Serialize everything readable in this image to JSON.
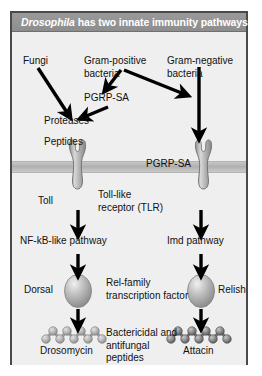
{
  "figure": {
    "title_italic": "Drosophila",
    "title_rest": " has two innate immunity pathways",
    "border_color": "#4a4a4a",
    "background_color": "#efefef",
    "title_bar_color": "#939393"
  },
  "labels": {
    "fungi": "Fungi",
    "gram_positive": "Gram-positive\nbacteria",
    "gram_negative": "Gram-negative\nbacteria",
    "pgrp_sa_left": "PGRP-SA",
    "pgrp_sa_right": "PGRP-SA",
    "proteases": "Proteases",
    "peptides": "Peptides",
    "toll": "Toll",
    "toll_like_receptor": "Toll-like\nreceptor (TLR)",
    "nfkb_pathway": "NF-kB-like pathway",
    "imd_pathway": "Imd pathway",
    "dorsal": "Dorsal",
    "relish": "Relish",
    "rel_family": "Rel-family\ntranscription factor",
    "drosomycin": "Drosomycin",
    "attacin": "Attacin",
    "bactericidal": "Bactericidal and\nantifungal\npeptides"
  },
  "shapes": {
    "membrane_name": "cell-membrane",
    "receptor_left_name": "toll-receptor",
    "receptor_right_name": "toll-like-receptor",
    "oval_left_name": "dorsal-protein",
    "oval_right_name": "relish-protein",
    "peptide_left_name": "drosomycin-peptide-chain",
    "peptide_right_name": "attacin-peptide-chain"
  }
}
